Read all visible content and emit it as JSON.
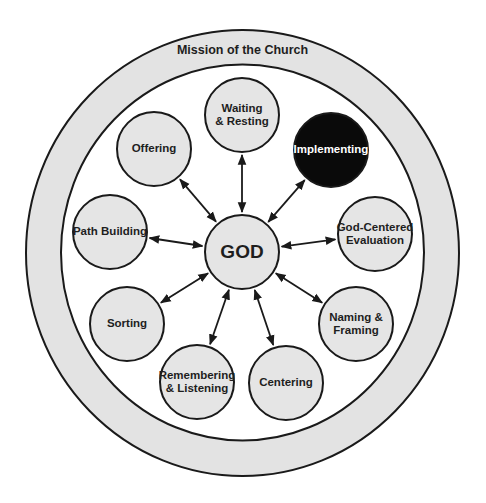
{
  "diagram": {
    "title": "Mission of the Church",
    "colors": {
      "background": "#ffffff",
      "ring_fill": "#e3e3e3",
      "inner_fill": "#ffffff",
      "node_fill": "#e5e5e5",
      "highlight_fill": "#0a0a0a",
      "highlight_text": "#ffffff",
      "stroke": "#1a1a1a",
      "text": "#1e1e1e"
    },
    "outer_ring": {
      "cx": 242.5,
      "cy": 253,
      "rx": 216.5,
      "ry": 223
    },
    "inner_area": {
      "cx": 242.5,
      "cy": 252.5,
      "rx": 181.5,
      "ry": 188
    },
    "ring_label_y": 51,
    "center": {
      "label": "GOD",
      "cx": 242,
      "cy": 252,
      "r": 37
    },
    "nodes": [
      {
        "id": "waiting-resting",
        "lines": [
          "Waiting",
          "& Resting"
        ],
        "cx": 242,
        "cy": 115,
        "r": 37,
        "highlighted": false
      },
      {
        "id": "implementing",
        "lines": [
          "Implementing"
        ],
        "cx": 331,
        "cy": 150,
        "r": 37,
        "highlighted": true
      },
      {
        "id": "god-centered-evaluation",
        "lines": [
          "God-Centered",
          "Evaluation"
        ],
        "cx": 375,
        "cy": 234,
        "r": 37,
        "highlighted": false
      },
      {
        "id": "naming-framing",
        "lines": [
          "Naming &",
          "Framing"
        ],
        "cx": 356,
        "cy": 324,
        "r": 37,
        "highlighted": false
      },
      {
        "id": "centering",
        "lines": [
          "Centering"
        ],
        "cx": 286,
        "cy": 383,
        "r": 37,
        "highlighted": false
      },
      {
        "id": "remembering-listening",
        "lines": [
          "Remembering",
          "& Listening"
        ],
        "cx": 197,
        "cy": 382,
        "r": 37,
        "highlighted": false
      },
      {
        "id": "sorting",
        "lines": [
          "Sorting"
        ],
        "cx": 127,
        "cy": 324,
        "r": 37,
        "highlighted": false
      },
      {
        "id": "path-building",
        "lines": [
          "Path Building"
        ],
        "cx": 110,
        "cy": 232,
        "r": 37,
        "highlighted": false
      },
      {
        "id": "offering",
        "lines": [
          "Offering"
        ],
        "cx": 154,
        "cy": 149,
        "r": 37,
        "highlighted": false
      }
    ],
    "connectors": {
      "type": "double-headed-arrow",
      "from": "center",
      "to": "each-node",
      "gap": 3
    }
  }
}
